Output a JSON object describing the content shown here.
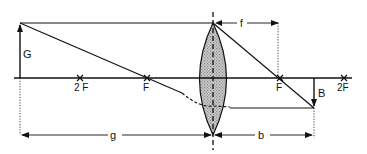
{
  "diagram": {
    "labels": {
      "object": "G",
      "image": "B",
      "focal_length": "f",
      "object_distance": "g",
      "image_distance": "b",
      "focus_left": "F",
      "double_focus_left": "2 F",
      "focus_right": "F",
      "double_focus_right": "2F"
    },
    "colors": {
      "line": "#111111",
      "lens_fill": "#b8b8b8",
      "background": "#ffffff"
    }
  }
}
